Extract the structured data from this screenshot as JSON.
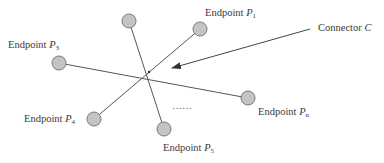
{
  "diagram": {
    "title": "",
    "connector": {
      "label_text": "Connector ",
      "label_symbol": "C",
      "color": "#555555"
    },
    "endpoints": [
      {
        "id": "top",
        "text": "",
        "symbol": "",
        "subscript": ""
      },
      {
        "id": "p1",
        "text": "Endpoint ",
        "symbol": "P",
        "subscript": "1"
      },
      {
        "id": "p3",
        "text": "Endpoint ",
        "symbol": "P",
        "subscript": "3"
      },
      {
        "id": "p4",
        "text": "Endpoint ",
        "symbol": "P",
        "subscript": "4"
      },
      {
        "id": "p5",
        "text": "Endpoint ",
        "symbol": "P",
        "subscript": "5"
      },
      {
        "id": "pn",
        "text": "Endpoint ",
        "symbol": "P",
        "subscript": "n"
      }
    ],
    "ellipsis": "……",
    "node_fill": "#c4c4c4",
    "node_stroke": "#7a7a7a",
    "line_color": "#555555"
  }
}
